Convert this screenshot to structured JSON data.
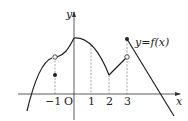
{
  "diagram": {
    "type": "function-graph",
    "function_label": "y=f(x)",
    "axes": {
      "x_label": "x",
      "y_label": "y",
      "origin_label": "O"
    },
    "x_ticks": [
      {
        "label": "−1",
        "value": -1
      },
      {
        "label": "1",
        "value": 1
      },
      {
        "label": "2",
        "value": 2
      },
      {
        "label": "3",
        "value": 3
      }
    ],
    "special_points": [
      {
        "x": -1,
        "kind": "open",
        "note": "limit from curve"
      },
      {
        "x": -1,
        "kind": "filled",
        "note": "f(-1) value below curve"
      },
      {
        "x": 0,
        "kind": "peak",
        "note": "local maximum on y-axis"
      },
      {
        "x": 2,
        "kind": "corner",
        "note": "local minimum"
      },
      {
        "x": 3,
        "kind": "open",
        "note": "left limit"
      },
      {
        "x": 3,
        "kind": "filled",
        "note": "f(3) jump up"
      }
    ],
    "colors": {
      "curve": "#222222",
      "axis": "#333333",
      "guide": "#666666"
    }
  }
}
